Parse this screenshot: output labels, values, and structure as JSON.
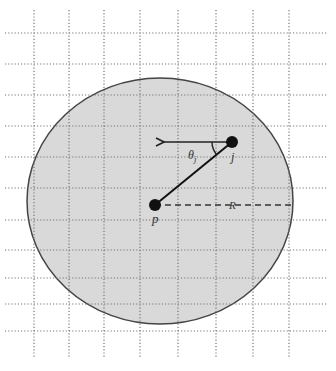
{
  "diagram": {
    "type": "geometry-figure",
    "grid": {
      "style": "dotted",
      "color": "#777777",
      "vertical_x": [
        34,
        69,
        104,
        140,
        178,
        216,
        253,
        289
      ],
      "horizontal_y": [
        33,
        64,
        95,
        126,
        157,
        188,
        220,
        250,
        278,
        304,
        331
      ],
      "x_extent": [
        5,
        328
      ],
      "y_extent": [
        10,
        358
      ]
    },
    "circle": {
      "cx": 160,
      "cy": 201,
      "rx": 133,
      "ry": 123,
      "fill": "#d9d9d9",
      "stroke": "#444444"
    },
    "points": {
      "p": {
        "x": 155,
        "y": 205,
        "label": "p"
      },
      "j": {
        "x": 232,
        "y": 142,
        "label": "j"
      }
    },
    "arrow": {
      "from_x": 232,
      "to_x": 164,
      "y": 142
    },
    "radius_line": {
      "label": "R",
      "from_x": 155,
      "to_x": 294,
      "y": 205
    },
    "angle": {
      "label_main": "θ",
      "label_sub": "j"
    },
    "labels": {
      "p": "p",
      "j": "j",
      "R": "R",
      "theta": "θ",
      "theta_sub": "j"
    }
  }
}
